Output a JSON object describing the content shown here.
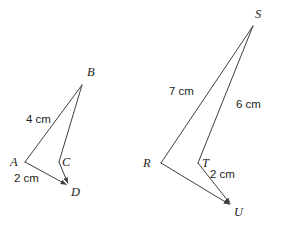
{
  "figure": {
    "kind": "geometry-diagram",
    "background_color": "#ffffff",
    "stroke_color": "#3f3f3f",
    "text_color": "#231f20",
    "stroke_width": 1
  },
  "shapes": [
    {
      "name": "left-figure",
      "vertices": [
        {
          "id": "A",
          "label": "A",
          "x": 25,
          "y": 162,
          "label_x": 10,
          "label_y": 156
        },
        {
          "id": "B",
          "label": "B",
          "x": 82,
          "y": 85,
          "label_x": 87,
          "label_y": 66
        },
        {
          "id": "C",
          "label": "C",
          "x": 59,
          "y": 162,
          "label_x": 62,
          "label_y": 156
        },
        {
          "id": "D",
          "label": "D",
          "x": 69,
          "y": 186,
          "label_x": 71,
          "label_y": 186
        }
      ],
      "edges": [
        {
          "from": "A",
          "to": "B",
          "arrow": false
        },
        {
          "from": "B",
          "to": "C",
          "arrow": false
        },
        {
          "from": "C",
          "to": "D",
          "arrow": true
        },
        {
          "from": "A",
          "to": "D",
          "arrow": true
        }
      ],
      "measures": [
        {
          "name": "side-AB-length",
          "text": "4 cm",
          "x": 26,
          "y": 114
        },
        {
          "name": "side-AD-length",
          "text": "2 cm",
          "x": 14,
          "y": 173
        }
      ]
    },
    {
      "name": "right-figure",
      "vertices": [
        {
          "id": "R",
          "label": "R",
          "x": 161,
          "y": 163,
          "label_x": 143,
          "label_y": 157
        },
        {
          "id": "S",
          "label": "S",
          "x": 253,
          "y": 26,
          "label_x": 255,
          "label_y": 8
        },
        {
          "id": "T",
          "label": "T",
          "x": 198,
          "y": 163,
          "label_x": 202,
          "label_y": 157
        },
        {
          "id": "U",
          "label": "U",
          "x": 232,
          "y": 206,
          "label_x": 234,
          "label_y": 206
        }
      ],
      "edges": [
        {
          "from": "R",
          "to": "S",
          "arrow": false
        },
        {
          "from": "S",
          "to": "T",
          "arrow": false
        },
        {
          "from": "T",
          "to": "U",
          "arrow": true
        },
        {
          "from": "R",
          "to": "U",
          "arrow": true
        }
      ],
      "measures": [
        {
          "name": "side-RS-length",
          "text": "7 cm",
          "x": 169,
          "y": 86
        },
        {
          "name": "side-SU-length",
          "text": "6 cm",
          "x": 236,
          "y": 99
        },
        {
          "name": "side-TU-length",
          "text": "2 cm",
          "x": 210,
          "y": 169
        }
      ]
    }
  ]
}
